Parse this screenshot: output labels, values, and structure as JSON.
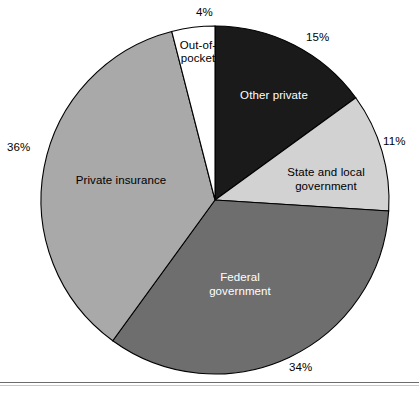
{
  "chart_data": {
    "type": "pie",
    "title": "",
    "subtitle": "",
    "xlabel": "",
    "ylabel": "",
    "legend_position": "none",
    "grid": false,
    "labels_inside_slices": true,
    "start_angle_deg": 0,
    "direction": "clockwise",
    "categories": [
      "Other private",
      "State and local government",
      "Federal government",
      "Private insurance",
      "Out-of-pocket"
    ],
    "values": [
      15,
      11,
      34,
      36,
      4
    ],
    "value_labels": [
      "15%",
      "11%",
      "34%",
      "36%",
      "4%"
    ],
    "slices": [
      {
        "label": "Other private",
        "label_display": "Other private",
        "value": 15,
        "value_label": "15%",
        "color": "#1a1a1a",
        "text_color": "#ffffff"
      },
      {
        "label": "State and local government",
        "label_display": "State and local\ngovernment",
        "value": 11,
        "value_label": "11%",
        "color": "#d2d2d2",
        "text_color": "#000000"
      },
      {
        "label": "Federal government",
        "label_display": "Federal\ngovernment",
        "value": 34,
        "value_label": "34%",
        "color": "#6e6e6e",
        "text_color": "#ffffff"
      },
      {
        "label": "Private insurance",
        "label_display": "Private insurance",
        "value": 36,
        "value_label": "36%",
        "color": "#a9a9a9",
        "text_color": "#000000"
      },
      {
        "label": "Out-of-pocket",
        "label_display": "Out-of-\npocket",
        "value": 4,
        "value_label": "4%",
        "color": "#ffffff",
        "text_color": "#000000"
      }
    ],
    "total": 100,
    "units": "percent",
    "outline_color": "#000000",
    "background_color": "#ffffff"
  },
  "figure": {
    "center_x": 215,
    "center_y": 200,
    "radius": 174
  }
}
